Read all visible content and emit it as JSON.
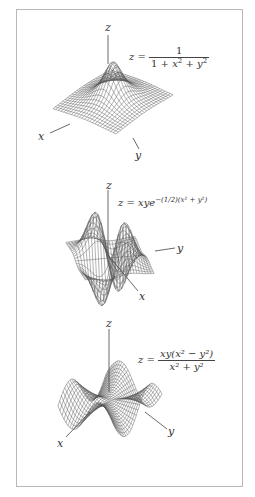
{
  "figure": {
    "panels": [
      {
        "id": "lorentzian",
        "axis_labels": {
          "z": "z",
          "x": "x",
          "y": "y"
        },
        "formula": {
          "lhs": "z =",
          "numerator": "1",
          "denominator_parts": [
            "1 + ",
            "x",
            "2",
            " + ",
            "y",
            "2"
          ]
        },
        "function": "1/(1+x^2+y^2)"
      },
      {
        "id": "gaussian-saddle",
        "axis_labels": {
          "z": "z",
          "x": "x",
          "y": "y"
        },
        "formula": {
          "lhs": "z = ",
          "body": "xye",
          "exponent": "−(1/2)(x² + y²)"
        },
        "function": "x*y*exp(-(x^2+y^2)/2)"
      },
      {
        "id": "monkey-saddle-ratio",
        "axis_labels": {
          "z": "z",
          "x": "x",
          "y": "y"
        },
        "formula": {
          "lhs": "z =",
          "numerator": "xy(x² − y²)",
          "denominator": "x² + y²"
        },
        "function": "x*y*(x^2-y^2)/(x^2+y^2)"
      }
    ]
  },
  "chart_data": [
    {
      "type": "surface",
      "title": "z = 1/(1 + x^2 + y^2)",
      "xlabel": "x",
      "ylabel": "y",
      "zlabel": "z",
      "domain": {
        "x": [
          -3,
          3
        ],
        "y": [
          -3,
          3
        ]
      },
      "grid": "wireframe",
      "zrange": [
        0,
        1
      ]
    },
    {
      "type": "surface",
      "title": "z = x y e^{-(1/2)(x^2 + y^2)}",
      "xlabel": "x",
      "ylabel": "y",
      "zlabel": "z",
      "domain": {
        "x": [
          -3,
          3
        ],
        "y": [
          -3,
          3
        ]
      },
      "grid": "wireframe",
      "zrange": [
        -0.37,
        0.37
      ]
    },
    {
      "type": "surface",
      "title": "z = x y (x^2 − y^2) / (x^2 + y^2)",
      "xlabel": "x",
      "ylabel": "y",
      "zlabel": "z",
      "domain": {
        "x": [
          -2,
          2
        ],
        "y": [
          -2,
          2
        ]
      },
      "grid": "wireframe"
    }
  ],
  "style": {
    "line_color": "#555555",
    "frame_color": "#b8b8b8"
  }
}
